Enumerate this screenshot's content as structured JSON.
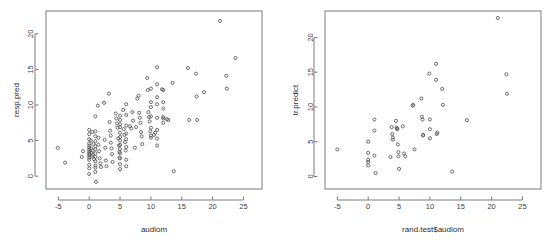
{
  "figure": {
    "background_color": "#ffffff",
    "point_color": "#555555",
    "axis_color": "#7a7a7a",
    "text_color": "#3c3c3c",
    "panel_count": 2
  },
  "chart_data": [
    {
      "type": "scatter",
      "panel": "left",
      "title": "",
      "xlabel": "audiom",
      "ylabel": "resp.pred",
      "xlim": [
        -7,
        28
      ],
      "ylim": [
        -1.8,
        23.2
      ],
      "xticks": [
        -5,
        0,
        5,
        10,
        15,
        20,
        25
      ],
      "yticks": [
        0,
        5,
        10,
        15,
        20
      ],
      "grid": false,
      "legend": null,
      "marker": "open-circle",
      "points": [
        [
          -5.1,
          4.0
        ],
        [
          -3.9,
          1.9
        ],
        [
          -1.2,
          2.7
        ],
        [
          -1.0,
          3.5
        ],
        [
          0.0,
          6.5
        ],
        [
          0.0,
          5.9
        ],
        [
          0.0,
          5.2
        ],
        [
          0.0,
          4.6
        ],
        [
          0.0,
          4.3
        ],
        [
          0.0,
          4.0
        ],
        [
          0.0,
          3.7
        ],
        [
          0.0,
          3.4
        ],
        [
          0.0,
          3.1
        ],
        [
          0.0,
          2.9
        ],
        [
          0.0,
          2.6
        ],
        [
          0.0,
          2.3
        ],
        [
          0.0,
          1.6
        ],
        [
          0.0,
          1.1
        ],
        [
          0.0,
          0.3
        ],
        [
          0.3,
          5.0
        ],
        [
          0.3,
          3.9
        ],
        [
          0.3,
          3.3
        ],
        [
          0.4,
          2.8
        ],
        [
          0.5,
          6.2
        ],
        [
          0.6,
          3.6
        ],
        [
          0.6,
          3.0
        ],
        [
          0.7,
          4.5
        ],
        [
          0.8,
          2.4
        ],
        [
          1.0,
          8.4
        ],
        [
          1.0,
          6.3
        ],
        [
          1.0,
          5.6
        ],
        [
          1.0,
          4.9
        ],
        [
          1.0,
          4.2
        ],
        [
          1.0,
          3.8
        ],
        [
          1.0,
          3.2
        ],
        [
          1.0,
          2.7
        ],
        [
          1.0,
          2.1
        ],
        [
          1.0,
          1.5
        ],
        [
          1.0,
          1.2
        ],
        [
          1.0,
          0.6
        ],
        [
          1.1,
          -0.8
        ],
        [
          1.4,
          9.9
        ],
        [
          1.5,
          5.4
        ],
        [
          1.5,
          4.4
        ],
        [
          1.6,
          3.5
        ],
        [
          1.7,
          2.5
        ],
        [
          1.8,
          1.8
        ],
        [
          1.9,
          1.3
        ],
        [
          2.4,
          10.3
        ],
        [
          2.5,
          5.1
        ],
        [
          2.6,
          4.0
        ],
        [
          2.7,
          2.2
        ],
        [
          2.8,
          1.4
        ],
        [
          3.2,
          11.6
        ],
        [
          3.3,
          7.6
        ],
        [
          3.4,
          6.4
        ],
        [
          3.5,
          5.7
        ],
        [
          3.5,
          4.7
        ],
        [
          3.6,
          3.9
        ],
        [
          3.7,
          3.1
        ],
        [
          3.8,
          2.0
        ],
        [
          4.3,
          8.8
        ],
        [
          4.4,
          8.1
        ],
        [
          4.5,
          7.4
        ],
        [
          4.6,
          6.8
        ],
        [
          4.7,
          5.3
        ],
        [
          4.8,
          4.3
        ],
        [
          4.9,
          3.4
        ],
        [
          4.9,
          2.6
        ],
        [
          5.0,
          8.5
        ],
        [
          5.0,
          7.9
        ],
        [
          5.0,
          7.3
        ],
        [
          5.0,
          6.9
        ],
        [
          5.0,
          6.1
        ],
        [
          5.0,
          5.5
        ],
        [
          5.0,
          5.0
        ],
        [
          5.0,
          4.4
        ],
        [
          5.0,
          3.8
        ],
        [
          5.0,
          3.2
        ],
        [
          5.0,
          2.5
        ],
        [
          5.0,
          1.7
        ],
        [
          5.0,
          1.0
        ],
        [
          5.5,
          9.3
        ],
        [
          5.6,
          6.6
        ],
        [
          5.7,
          5.8
        ],
        [
          5.8,
          4.8
        ],
        [
          5.9,
          3.6
        ],
        [
          6.0,
          10.1
        ],
        [
          6.0,
          8.6
        ],
        [
          6.0,
          7.1
        ],
        [
          6.0,
          6.0
        ],
        [
          6.0,
          5.2
        ],
        [
          6.0,
          4.1
        ],
        [
          6.0,
          2.3
        ],
        [
          6.0,
          1.4
        ],
        [
          6.6,
          7.0
        ],
        [
          6.8,
          6.7
        ],
        [
          7.0,
          9.0
        ],
        [
          7.1,
          7.8
        ],
        [
          7.4,
          4.0
        ],
        [
          7.6,
          6.9
        ],
        [
          7.8,
          10.9
        ],
        [
          8.0,
          11.3
        ],
        [
          8.1,
          8.9
        ],
        [
          8.2,
          8.2
        ],
        [
          8.3,
          7.5
        ],
        [
          8.4,
          6.2
        ],
        [
          8.5,
          5.6
        ],
        [
          8.6,
          4.5
        ],
        [
          9.4,
          13.8
        ],
        [
          9.5,
          12.1
        ],
        [
          9.6,
          9.0
        ],
        [
          9.7,
          8.3
        ],
        [
          9.8,
          7.7
        ],
        [
          9.9,
          6.3
        ],
        [
          10.0,
          12.3
        ],
        [
          10.0,
          10.4
        ],
        [
          10.0,
          9.7
        ],
        [
          10.0,
          8.4
        ],
        [
          10.0,
          6.8
        ],
        [
          10.0,
          5.7
        ],
        [
          10.0,
          5.4
        ],
        [
          10.5,
          5.8
        ],
        [
          10.7,
          6.1
        ],
        [
          11.0,
          15.3
        ],
        [
          11.0,
          12.9
        ],
        [
          11.0,
          11.1
        ],
        [
          11.0,
          10.1
        ],
        [
          11.0,
          8.2
        ],
        [
          11.0,
          6.5
        ],
        [
          11.0,
          5.3
        ],
        [
          11.0,
          4.3
        ],
        [
          11.8,
          12.2
        ],
        [
          12.0,
          12.1
        ],
        [
          12.0,
          10.4
        ],
        [
          12.0,
          9.5
        ],
        [
          12.0,
          8.3
        ],
        [
          12.0,
          8.1
        ],
        [
          12.0,
          7.5
        ],
        [
          12.6,
          8.0
        ],
        [
          12.8,
          7.9
        ],
        [
          13.5,
          13.1
        ],
        [
          13.7,
          0.7
        ],
        [
          16.0,
          15.2
        ],
        [
          16.2,
          7.9
        ],
        [
          17.3,
          14.4
        ],
        [
          17.4,
          11.2
        ],
        [
          17.5,
          7.9
        ],
        [
          18.6,
          11.8
        ],
        [
          21.2,
          21.8
        ],
        [
          22.2,
          14.1
        ],
        [
          22.3,
          12.3
        ],
        [
          23.7,
          16.6
        ]
      ]
    },
    {
      "type": "scatter",
      "panel": "right",
      "title": "",
      "xlabel": "rand.test$audiom",
      "ylabel": "tr.predict",
      "xlim": [
        -7,
        28
      ],
      "ylim": [
        -1.8,
        23.8
      ],
      "xticks": [
        -5,
        0,
        5,
        10,
        15,
        20,
        25
      ],
      "yticks": [
        0,
        5,
        10,
        15,
        20
      ],
      "grid": false,
      "legend": null,
      "marker": "open-circle",
      "points": [
        [
          -5.0,
          3.9
        ],
        [
          0.0,
          5.0
        ],
        [
          0.0,
          3.4
        ],
        [
          0.0,
          2.4
        ],
        [
          0.0,
          2.1
        ],
        [
          0.0,
          1.6
        ],
        [
          1.0,
          8.2
        ],
        [
          1.0,
          6.6
        ],
        [
          1.0,
          3.0
        ],
        [
          1.2,
          0.5
        ],
        [
          3.6,
          2.8
        ],
        [
          3.8,
          7.1
        ],
        [
          3.9,
          6.1
        ],
        [
          4.0,
          5.6
        ],
        [
          4.0,
          5.3
        ],
        [
          4.5,
          8.0
        ],
        [
          4.6,
          7.0
        ],
        [
          4.7,
          6.9
        ],
        [
          4.7,
          6.8
        ],
        [
          4.8,
          4.6
        ],
        [
          4.9,
          3.5
        ],
        [
          4.9,
          2.9
        ],
        [
          5.0,
          1.1
        ],
        [
          5.6,
          7.2
        ],
        [
          5.8,
          3.3
        ],
        [
          6.0,
          2.9
        ],
        [
          7.2,
          10.2
        ],
        [
          7.3,
          10.3
        ],
        [
          7.5,
          3.9
        ],
        [
          8.6,
          11.2
        ],
        [
          8.7,
          8.6
        ],
        [
          8.8,
          8.2
        ],
        [
          8.9,
          6.0
        ],
        [
          8.9,
          5.9
        ],
        [
          9.9,
          14.8
        ],
        [
          10.0,
          8.2
        ],
        [
          10.0,
          6.8
        ],
        [
          10.0,
          5.5
        ],
        [
          11.0,
          16.2
        ],
        [
          11.0,
          13.9
        ],
        [
          11.1,
          6.1
        ],
        [
          11.2,
          6.3
        ],
        [
          12.0,
          12.6
        ],
        [
          12.1,
          10.3
        ],
        [
          13.6,
          0.7
        ],
        [
          16.0,
          8.1
        ],
        [
          21.0,
          22.8
        ],
        [
          22.4,
          14.7
        ],
        [
          22.5,
          11.9
        ]
      ]
    }
  ]
}
